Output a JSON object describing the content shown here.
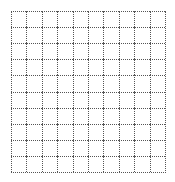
{
  "grid": {
    "rows": 10,
    "columns": 10,
    "line_style": "dotted",
    "line_color": "#555555",
    "background_color": "#ffffff",
    "cells": []
  }
}
